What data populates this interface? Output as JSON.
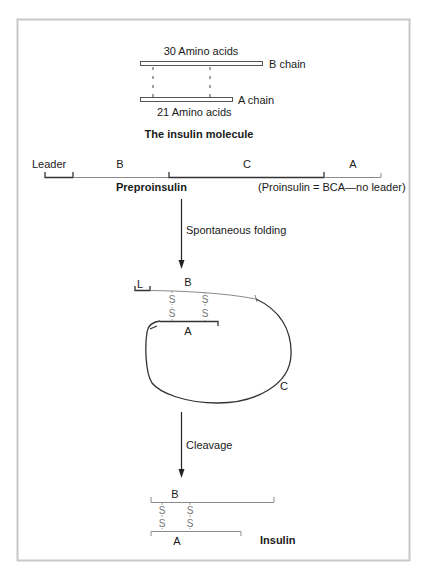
{
  "diagram": {
    "section_molecule": {
      "b_length_label": "30 Amino acids",
      "b_chain_label": "B chain",
      "a_chain_label": "A chain",
      "a_length_label": "21 Amino acids",
      "caption": "The insulin molecule"
    },
    "section_preproinsulin": {
      "segments": [
        {
          "label": "Leader"
        },
        {
          "label": "B"
        },
        {
          "label": "C"
        },
        {
          "label": "A"
        }
      ],
      "caption": "Preproinsulin",
      "note": "(Proinsulin = BCA—no leader)"
    },
    "step1": {
      "label": "Spontaneous folding"
    },
    "section_folded": {
      "leader_label": "L",
      "b_label": "B",
      "a_label": "A",
      "c_label": "C",
      "disulfide_symbol": "S"
    },
    "step2": {
      "label": "Cleavage"
    },
    "section_insulin": {
      "b_label": "B",
      "a_label": "A",
      "disulfide_symbol": "S",
      "caption": "Insulin"
    },
    "colors": {
      "frame": "#c8c8c8",
      "line_dark": "#333333",
      "line_light": "#8a8a8a",
      "disulfide": "#777777"
    }
  }
}
